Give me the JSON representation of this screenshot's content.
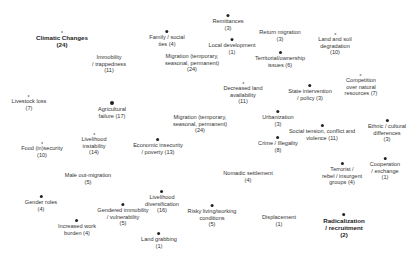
{
  "diagram": {
    "type": "network-node-labels",
    "nodes": [
      {
        "id": "climatic-changes",
        "lines": [
          "Climatic Changes",
          "(24)"
        ],
        "x": 62,
        "y": 31,
        "dot": "sm",
        "bold": true
      },
      {
        "id": "remittances",
        "lines": [
          "Remittances",
          "(3)"
        ],
        "x": 228,
        "y": 14,
        "dot": "md"
      },
      {
        "id": "family-social-ties",
        "lines": [
          "Family / social",
          "ties (4)"
        ],
        "x": 167,
        "y": 30,
        "dot": "md"
      },
      {
        "id": "return-migration",
        "lines": [
          "Return migration",
          "(3)"
        ],
        "x": 280,
        "y": 29,
        "dot": "none"
      },
      {
        "id": "land-soil-degradation",
        "lines": [
          "Land and soil",
          "degradation",
          "(10)"
        ],
        "x": 335,
        "y": 33,
        "dot": "sm"
      },
      {
        "id": "local-development",
        "lines": [
          "Local development",
          "(1)"
        ],
        "x": 232,
        "y": 38,
        "dot": "md"
      },
      {
        "id": "immobility-trappedness",
        "lines": [
          "Immobility",
          "/ trappedness",
          "(11)"
        ],
        "x": 109,
        "y": 54,
        "dot": "none"
      },
      {
        "id": "migration-top",
        "lines": [
          "Migration (temporary,",
          "seasonal, permanent)",
          "(24)"
        ],
        "x": 192,
        "y": 53,
        "dot": "none"
      },
      {
        "id": "territorial-ownership",
        "lines": [
          "Territorial/ownership",
          "issues (6)"
        ],
        "x": 280,
        "y": 51,
        "dot": "md"
      },
      {
        "id": "competition-natural-resources",
        "lines": [
          "Competition",
          "over natural",
          "resources (7)"
        ],
        "x": 361,
        "y": 74,
        "dot": "sm"
      },
      {
        "id": "livestock-loss",
        "lines": [
          "Livestock loss",
          "(7)"
        ],
        "x": 29,
        "y": 95,
        "dot": "sm"
      },
      {
        "id": "agricultural-failure",
        "lines": [
          "Agricultural",
          "failure (17)"
        ],
        "x": 112,
        "y": 101,
        "dot": "lg"
      },
      {
        "id": "decreased-land-availability",
        "lines": [
          "Decreased land",
          "availability",
          "(11)"
        ],
        "x": 243,
        "y": 82,
        "dot": "sm"
      },
      {
        "id": "state-intervention",
        "lines": [
          "State intervention",
          "/ policy (3)"
        ],
        "x": 310,
        "y": 84,
        "dot": "md"
      },
      {
        "id": "migration-center",
        "lines": [
          "Migration (temporary,",
          "seasonal, permanent)",
          "(24)"
        ],
        "x": 200,
        "y": 114,
        "dot": "none"
      },
      {
        "id": "urbanization",
        "lines": [
          "Urbanization",
          "(3)"
        ],
        "x": 278,
        "y": 110,
        "dot": "md"
      },
      {
        "id": "ethnic-cultural-differences",
        "lines": [
          "Ethnic / cultural",
          "differences",
          "(3)"
        ],
        "x": 387,
        "y": 119,
        "dot": "md"
      },
      {
        "id": "social-tension-conflict",
        "lines": [
          "Social tension, conflict and",
          "violence (11)"
        ],
        "x": 322,
        "y": 124,
        "dot": "md"
      },
      {
        "id": "food-insecurity",
        "lines": [
          "Food (in)security",
          "(10)"
        ],
        "x": 42,
        "y": 142,
        "dot": "sm"
      },
      {
        "id": "livelihood-instability",
        "lines": [
          "Livelihood",
          "instability",
          "(14)"
        ],
        "x": 94,
        "y": 133,
        "dot": "sm"
      },
      {
        "id": "economic-insecurity",
        "lines": [
          "Economic insecurity",
          "/ poverty (13)"
        ],
        "x": 158,
        "y": 138,
        "dot": "md"
      },
      {
        "id": "crime-illegality",
        "lines": [
          "Crime / Illegality",
          "(8)"
        ],
        "x": 278,
        "y": 136,
        "dot": "md"
      },
      {
        "id": "cooperation-exchange",
        "lines": [
          "Cooperation",
          "/ exchange",
          "(1)"
        ],
        "x": 385,
        "y": 157,
        "dot": "md"
      },
      {
        "id": "terrorist-groups",
        "lines": [
          "Terrorist /",
          "rebel / insurgent",
          "groups (4)"
        ],
        "x": 342,
        "y": 162,
        "dot": "md"
      },
      {
        "id": "male-out-migration",
        "lines": [
          "Male out-migration",
          "(5)"
        ],
        "x": 88,
        "y": 172,
        "dot": "none"
      },
      {
        "id": "nomadic-settlement",
        "lines": [
          "Nomadic settlement",
          "(4)"
        ],
        "x": 248,
        "y": 170,
        "dot": "none"
      },
      {
        "id": "gender-roles",
        "lines": [
          "Gender roles",
          "(4)"
        ],
        "x": 41,
        "y": 195,
        "dot": "md"
      },
      {
        "id": "gendered-immobility",
        "lines": [
          "Gendered immobility",
          "/ vulnerability",
          "(5)"
        ],
        "x": 123,
        "y": 203,
        "dot": "md"
      },
      {
        "id": "livelihood-diversification",
        "lines": [
          "Livelihood",
          "diversification",
          "(16)"
        ],
        "x": 162,
        "y": 190,
        "dot": "md"
      },
      {
        "id": "increased-work-burden",
        "lines": [
          "Increased work",
          "burden (4)"
        ],
        "x": 77,
        "y": 219,
        "dot": "md"
      },
      {
        "id": "risky-living-conditions",
        "lines": [
          "Risky living/working",
          "conditions",
          "(5)"
        ],
        "x": 212,
        "y": 204,
        "dot": "md"
      },
      {
        "id": "displacement",
        "lines": [
          "Displacement",
          "(1)"
        ],
        "x": 279,
        "y": 214,
        "dot": "none"
      },
      {
        "id": "radicalization-recruitment",
        "lines": [
          "Radicalization",
          "/ recruitment",
          "(2)"
        ],
        "x": 344,
        "y": 213,
        "dot": "md",
        "bold": true
      },
      {
        "id": "land-grabbing",
        "lines": [
          "Land grabbing",
          "(1)"
        ],
        "x": 159,
        "y": 232,
        "dot": "md"
      }
    ]
  }
}
